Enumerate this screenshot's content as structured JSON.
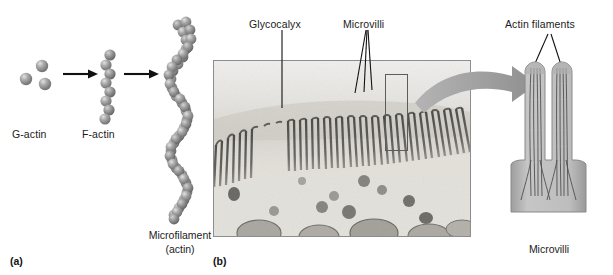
{
  "figure": {
    "background": "#ffffff",
    "width": 613,
    "height": 275
  },
  "panel_a": {
    "tag": "(a)",
    "steps": [
      {
        "name": "g-actin",
        "label": "G-actin",
        "description": "three globular actin monomers"
      },
      {
        "name": "f-actin",
        "label": "F-actin",
        "description": "single-strand chain of actin subunits"
      },
      {
        "name": "microfilament",
        "label": "Microfilament",
        "sublabel": "(actin)",
        "description": "double-helical polymer of actin subunits"
      }
    ],
    "arrows": [
      {
        "name": "arrow-g-to-f"
      },
      {
        "name": "arrow-f-to-microfilament"
      }
    ],
    "colors": {
      "bead_fill": "#9a9a9a",
      "bead_highlight": "#d0d0d0",
      "bead_shadow": "#6e6e6e",
      "arrow": "#111111"
    }
  },
  "panel_b": {
    "tag": "(b)",
    "micrograph": {
      "name": "electron-micrograph",
      "caption_labels": [
        {
          "name": "glycocalyx",
          "label": "Glycocalyx"
        },
        {
          "name": "microvilli",
          "label": "Microvilli"
        }
      ],
      "highlight_box_name": "inset-highlight-box",
      "border_color": "#8d8d8d"
    },
    "zoom_arrow": {
      "name": "zoom-arrow",
      "color": "#9b9b9b"
    },
    "detail": {
      "name": "microvilli-detail",
      "label": "Microvilli",
      "callout": "Actin filaments",
      "colors": {
        "membrane_fill": "#b8b8b8",
        "cytosol_fill": "#cfcfcf",
        "filament": "#4a4a4a",
        "outline": "#8a8a8a"
      }
    }
  }
}
